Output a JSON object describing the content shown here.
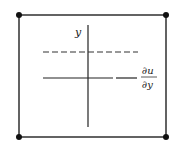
{
  "diagram": {
    "type": "velocity-gradient-element",
    "labels": {
      "axis": "y",
      "numerator": "∂u",
      "denominator": "∂y"
    },
    "colors": {
      "line": "#222222",
      "dot": "#111111",
      "background": "#ffffff"
    }
  }
}
